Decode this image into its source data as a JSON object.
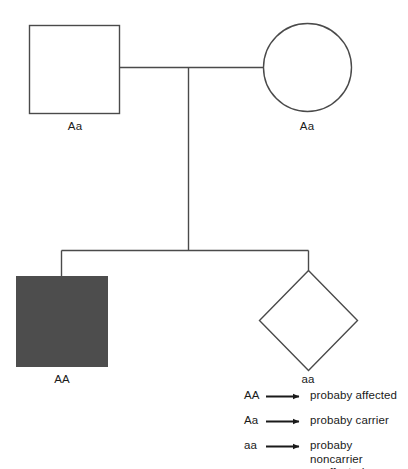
{
  "diagram": {
    "type": "pedigree-chart",
    "line_color": "#4a4a4a",
    "affected_fill": "#4d4d4d",
    "unaffected_fill": "#ffffff",
    "generations": [
      {
        "id": "generation-1",
        "individuals": [
          {
            "id": "father",
            "shape": "square",
            "sex": "male",
            "status": "unaffected",
            "genotype": "Aa"
          },
          {
            "id": "mother",
            "shape": "circle",
            "sex": "female",
            "status": "unaffected",
            "genotype": "Aa"
          }
        ]
      },
      {
        "id": "generation-2",
        "individuals": [
          {
            "id": "child-1",
            "shape": "square",
            "sex": "male",
            "status": "affected",
            "genotype": "AA"
          },
          {
            "id": "child-2",
            "shape": "diamond",
            "sex": "unknown",
            "status": "unaffected",
            "genotype": "aa"
          }
        ]
      }
    ]
  },
  "legend": {
    "rows": [
      {
        "genotype": "AA",
        "arrow": "right-arrow-icon",
        "description_line1": "probaby affected",
        "description_line2": ""
      },
      {
        "genotype": "Aa",
        "arrow": "right-arrow-icon",
        "description_line1": "probaby carrier",
        "description_line2": ""
      },
      {
        "genotype": "aa",
        "arrow": "right-arrow-icon",
        "description_line1": "probaby noncarrier",
        "description_line2": "unaffected"
      }
    ]
  }
}
